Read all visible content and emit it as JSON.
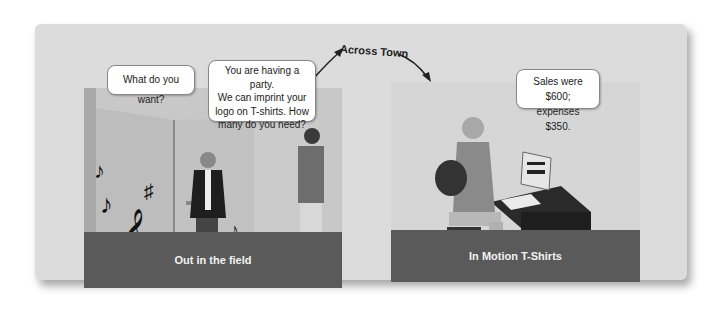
{
  "scene": {
    "transition_label": "Across Town",
    "panels": [
      {
        "caption": "Out in the field",
        "bubbles": [
          {
            "speaker": "customer",
            "text": "What do you want?"
          },
          {
            "speaker": "salesperson",
            "text": "You are having a party.\nWe can imprint your\nlogo on T-shirts. How\nmany do you need?"
          }
        ]
      },
      {
        "caption": "In Motion T-Shirts",
        "bubbles": [
          {
            "speaker": "office-worker",
            "text": "Sales were $600;\nexpenses $350."
          }
        ]
      }
    ]
  },
  "colors": {
    "card_bg": "#dcdcdc",
    "caption_bg": "#5a5a5a",
    "caption_text": "#f2f2f2"
  }
}
